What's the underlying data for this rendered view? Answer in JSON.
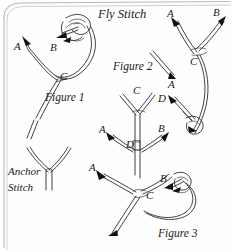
{
  "document": {
    "title": "Fly Stitch",
    "type": "embroidery-stitch-instruction-diagram",
    "background_color": "#fefefe",
    "ink_color": "#2b2b2b",
    "frame_color": "#b9b9b9"
  },
  "figures": [
    {
      "id": "figure-1",
      "caption": "Figure 1",
      "points": [
        "A",
        "B",
        "C"
      ]
    },
    {
      "id": "figure-2",
      "caption": "Figure 2",
      "points": [
        "A",
        "A",
        "B",
        "C",
        "D"
      ]
    },
    {
      "id": "figure-3",
      "caption": "Figure 3",
      "points": [
        "A",
        "B",
        "C",
        "D",
        "A",
        "B",
        "C"
      ]
    }
  ],
  "anchor_stitch": {
    "line1": "Anchor",
    "line2": "Stitch"
  },
  "labels": {
    "fig1_a": "A",
    "fig1_b": "B",
    "fig1_c": "C",
    "fig1_caption": "Figure 1",
    "fig2_caption": "Figure 2",
    "fig2_needle_a": "A",
    "fig2_a": "A",
    "fig2_b": "B",
    "fig2_c": "C",
    "fig2_d": "D",
    "fig3_upper_c": "C",
    "fig3_mid_a": "A",
    "fig3_mid_b": "B",
    "fig3_mid_d": "D",
    "fig3_low_a": "A",
    "fig3_low_b": "B",
    "fig3_low_c": "C",
    "fig3_caption": "Figure 3"
  }
}
